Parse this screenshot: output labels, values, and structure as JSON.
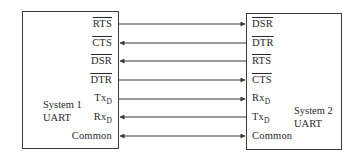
{
  "diagram": {
    "type": "uart-handshake-wiring",
    "system1": {
      "name_line1": "System 1",
      "name_line2": "UART",
      "signals": [
        {
          "base": "RTS",
          "sub": "",
          "overline": true
        },
        {
          "base": "CTS",
          "sub": "",
          "overline": true
        },
        {
          "base": "DSR",
          "sub": "",
          "overline": true
        },
        {
          "base": "DTR",
          "sub": "",
          "overline": true
        },
        {
          "base": "Tx",
          "sub": "D",
          "overline": false
        },
        {
          "base": "Rx",
          "sub": "D",
          "overline": false
        },
        {
          "base": "Common",
          "sub": "",
          "overline": false
        }
      ]
    },
    "system2": {
      "name_line1": "System 2",
      "name_line2": "UART",
      "signals": [
        {
          "base": "DSR",
          "sub": "",
          "overline": true
        },
        {
          "base": "DTR",
          "sub": "",
          "overline": true
        },
        {
          "base": "RTS",
          "sub": "",
          "overline": true
        },
        {
          "base": "CTS",
          "sub": "",
          "overline": true
        },
        {
          "base": "Rx",
          "sub": "D",
          "overline": false
        },
        {
          "base": "Tx",
          "sub": "D",
          "overline": false
        },
        {
          "base": "Common",
          "sub": "",
          "overline": false
        }
      ]
    },
    "connections": [
      {
        "from": "System 1 RTS",
        "to": "System 2 DSR",
        "direction": "right"
      },
      {
        "from": "System 2 DTR",
        "to": "System 1 CTS",
        "direction": "left"
      },
      {
        "from": "System 2 RTS",
        "to": "System 1 DSR",
        "direction": "left"
      },
      {
        "from": "System 1 DTR",
        "to": "System 2 CTS",
        "direction": "right"
      },
      {
        "from": "System 1 TxD",
        "to": "System 2 RxD",
        "direction": "right"
      },
      {
        "from": "System 2 TxD",
        "to": "System 1 RxD",
        "direction": "left"
      },
      {
        "from": "System 1 Common",
        "to": "System 2 Common",
        "direction": "both"
      }
    ],
    "colors": {
      "line": "#3a3a3a",
      "text": "#2a2a2a",
      "background": "#ffffff"
    }
  }
}
